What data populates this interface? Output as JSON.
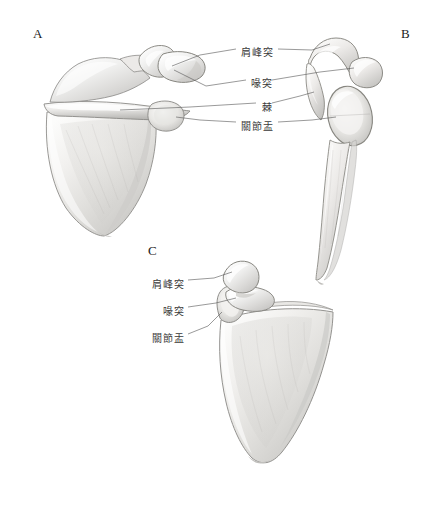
{
  "figure": {
    "background_color": "#ffffff",
    "label_color": "#3a3a3a",
    "letter_color": "#1a1a1a",
    "leader_line_color": "#555555"
  },
  "panels": [
    {
      "id": "A",
      "letter": "A",
      "view": "posterior-view-scapula",
      "x": 33,
      "y": 26
    },
    {
      "id": "B",
      "letter": "B",
      "view": "lateral-view-scapula",
      "x": 401,
      "y": 26
    },
    {
      "id": "C",
      "letter": "C",
      "view": "anterior-view-scapula",
      "x": 148,
      "y": 243
    }
  ],
  "labels_top": [
    {
      "id": "acromion",
      "text": "肩峰突",
      "x": 241,
      "y": 44
    },
    {
      "id": "coracoid",
      "text": "喙突",
      "x": 251,
      "y": 75
    },
    {
      "id": "spine",
      "text": "棘",
      "x": 262,
      "y": 99
    },
    {
      "id": "glenoid",
      "text": "關節盂",
      "x": 241,
      "y": 118
    }
  ],
  "labels_bottom": [
    {
      "id": "acromion-c",
      "text": "肩峰突",
      "x": 152,
      "y": 276
    },
    {
      "id": "coracoid-c",
      "text": "喙突",
      "x": 163,
      "y": 303
    },
    {
      "id": "glenoid-c",
      "text": "關節盂",
      "x": 152,
      "y": 330
    }
  ]
}
